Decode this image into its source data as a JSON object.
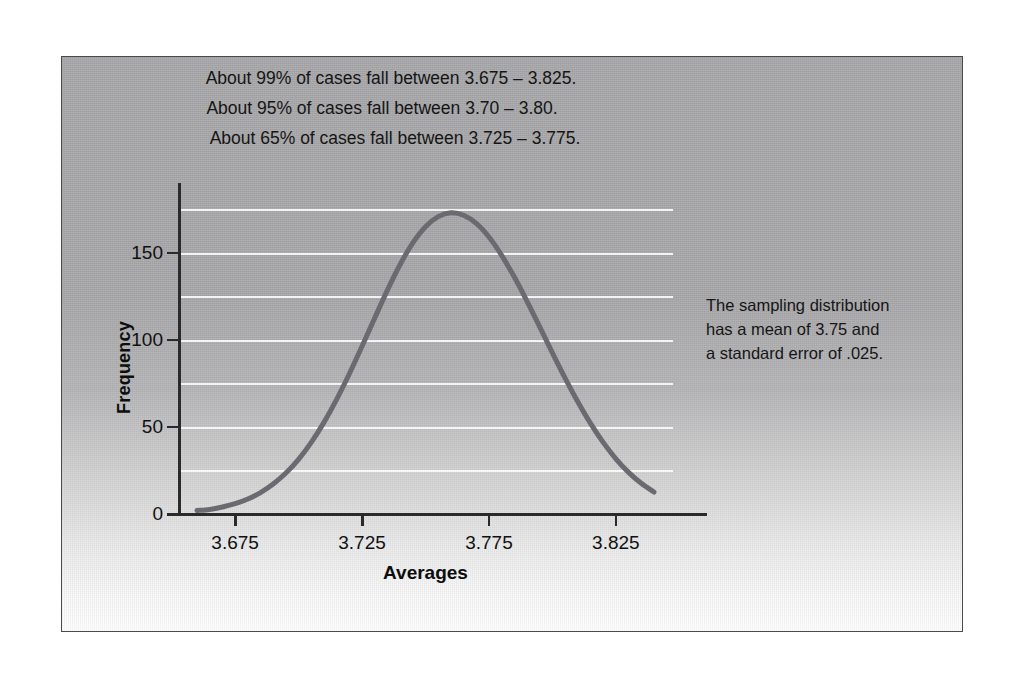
{
  "figure": {
    "panel_bg_top_color": "#a6a6a8",
    "panel_bg_bottom_color": "#fdfdfd",
    "border_color": "#4a4a4a",
    "page_bg_color": "#ffffff"
  },
  "annotations": {
    "top": [
      "About 99% of cases fall between 3.675 – 3.825.",
      "About 95% of cases fall between 3.70 – 3.80.",
      "About 65% of cases fall between 3.725 – 3.775."
    ],
    "right": [
      "The sampling distribution",
      "has a mean of 3.75 and",
      "a standard error of .025."
    ]
  },
  "chart_data": {
    "type": "line",
    "title": "",
    "xlabel": "Averages",
    "ylabel": "Frequency",
    "xlim": [
      3.6525,
      3.8475
    ],
    "ylim": [
      0,
      190
    ],
    "xticks": [
      3.675,
      3.725,
      3.775,
      3.825
    ],
    "xtick_labels": [
      "3.675",
      "3.725",
      "3.775",
      "3.825"
    ],
    "yticks": [
      0,
      50,
      100,
      150
    ],
    "ytick_labels": [
      "0",
      "50",
      "100",
      "150"
    ],
    "grid": true,
    "grid_color": "#fafafa",
    "grid_values": [
      25,
      50,
      75,
      100,
      125,
      150,
      175
    ],
    "legend": null,
    "curve_color": "#6a6a70",
    "curve_width": 5,
    "distribution": {
      "kind": "normal",
      "mean": 3.75,
      "standard_error": 0.025,
      "peak_frequency": 176
    },
    "x": [
      3.66,
      3.665,
      3.67,
      3.675,
      3.68,
      3.685,
      3.69,
      3.695,
      3.7,
      3.705,
      3.71,
      3.715,
      3.72,
      3.725,
      3.73,
      3.735,
      3.74,
      3.745,
      3.75,
      3.755,
      3.76,
      3.765,
      3.77,
      3.775,
      3.78,
      3.785,
      3.79,
      3.795,
      3.8,
      3.805,
      3.81,
      3.815,
      3.82,
      3.825,
      3.83,
      3.835,
      3.84
    ],
    "y": [
      2.0,
      2.6,
      4.0,
      5.9,
      8.6,
      12.3,
      17.2,
      23.5,
      31.4,
      41.1,
      52.6,
      65.8,
      80.5,
      96.3,
      112.5,
      128.5,
      143.2,
      155.6,
      164.9,
      170.7,
      172.9,
      171.5,
      166.8,
      159.0,
      148.5,
      136.0,
      122.1,
      107.4,
      92.5,
      78.0,
      64.4,
      52.0,
      41.1,
      31.7,
      23.9,
      17.6,
      12.6
    ]
  }
}
